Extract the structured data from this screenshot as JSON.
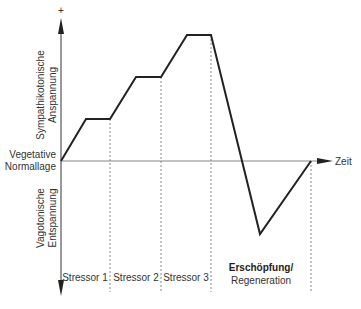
{
  "diagram": {
    "type": "stress-response curve",
    "y_axis": {
      "top_symbol": "+",
      "upper_label_line1": "Sympathikotonische",
      "upper_label_line2": "Anspannung",
      "lower_label_line1": "Vagotonische",
      "lower_label_line2": "Entspannung"
    },
    "baseline": {
      "label_line1": "Vegetative",
      "label_line2": "Normallage"
    },
    "x_axis": {
      "label": "Zeit"
    },
    "phases": [
      {
        "label": "Stressor 1"
      },
      {
        "label": "Stressor 2"
      },
      {
        "label": "Stressor 3"
      },
      {
        "label_line1": "Erschöpfung/",
        "label_line2": "Regeneration"
      }
    ],
    "curve_points_px": [
      [
        61,
        161
      ],
      [
        86,
        119
      ],
      [
        110,
        119
      ],
      [
        136,
        77
      ],
      [
        161,
        77
      ],
      [
        187,
        35
      ],
      [
        211,
        35
      ],
      [
        260,
        234
      ],
      [
        311,
        161
      ]
    ],
    "colors": {
      "curve": "#222222",
      "axis": "#777777",
      "dashed": "#888888"
    }
  }
}
